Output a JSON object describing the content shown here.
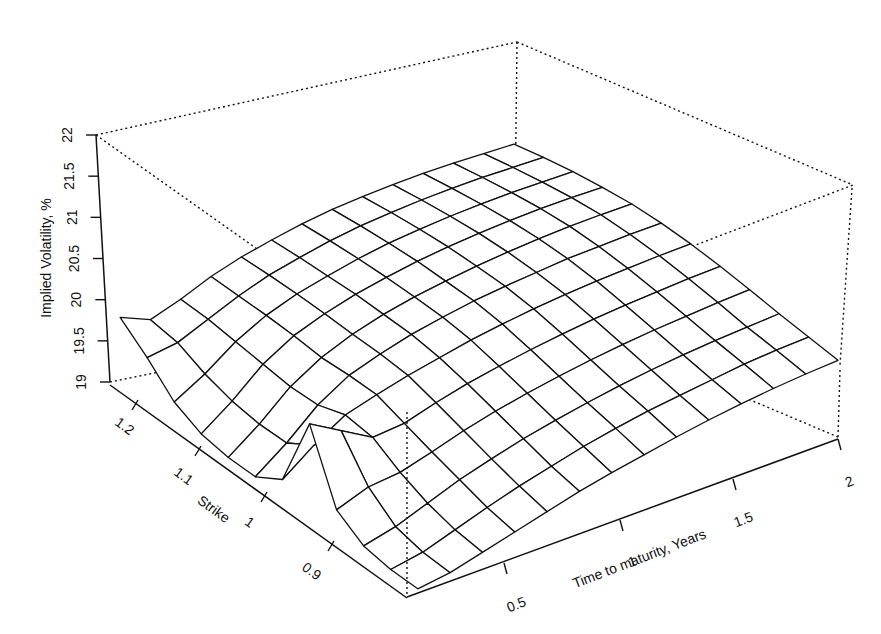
{
  "chart_data": {
    "type": "surface3d",
    "title": "",
    "zlabel": "Implied Volatility, %",
    "xlabel": "Time to maturity, Years",
    "ylabel": "Strike",
    "z_ticks": [
      "19",
      "19.5",
      "20",
      "20.5",
      "21",
      "21.5",
      "22"
    ],
    "x_ticks": [
      "0.5",
      "1",
      "1.5",
      "2"
    ],
    "y_ticks": [
      "1.2",
      "1.1",
      "1",
      "0.9"
    ],
    "zlim": [
      19,
      22
    ],
    "xlim": [
      0,
      2
    ],
    "ylim": [
      0.82,
      1.26
    ],
    "grid": "wireframe mesh, dotted bounding box",
    "strike_grid": [
      0.82,
      0.86,
      0.9,
      0.94,
      0.98,
      1.02,
      1.06,
      1.1,
      1.14,
      1.18,
      1.22,
      1.26
    ],
    "time_grid": [
      0.05,
      0.2,
      0.35,
      0.5,
      0.65,
      0.8,
      0.95,
      1.1,
      1.25,
      1.4,
      1.55,
      1.7,
      1.85,
      2.0
    ],
    "values": [
      [
        19.05,
        19.1,
        19.2,
        19.3,
        19.4,
        19.5,
        19.58,
        19.65,
        19.72,
        19.78,
        19.83,
        19.87,
        19.9,
        19.92
      ],
      [
        19.05,
        19.12,
        19.25,
        19.38,
        19.5,
        19.6,
        19.7,
        19.78,
        19.85,
        19.9,
        19.95,
        20.0,
        20.03,
        20.05
      ],
      [
        19.1,
        19.2,
        19.35,
        19.5,
        19.62,
        19.73,
        19.82,
        19.9,
        19.97,
        20.03,
        20.08,
        20.12,
        20.15,
        20.18
      ],
      [
        19.3,
        19.45,
        19.5,
        19.62,
        19.75,
        19.86,
        19.95,
        20.03,
        20.1,
        20.16,
        20.21,
        20.25,
        20.29,
        20.32
      ],
      [
        20.1,
        19.9,
        19.7,
        19.75,
        19.88,
        19.99,
        20.08,
        20.16,
        20.23,
        20.29,
        20.34,
        20.38,
        20.42,
        20.45
      ],
      [
        19.2,
        19.5,
        19.75,
        19.88,
        20.0,
        20.1,
        20.2,
        20.28,
        20.35,
        20.41,
        20.46,
        20.5,
        20.54,
        20.57
      ],
      [
        19.0,
        19.3,
        19.65,
        19.9,
        20.05,
        20.18,
        20.28,
        20.37,
        20.44,
        20.5,
        20.56,
        20.6,
        20.64,
        20.67
      ],
      [
        19.0,
        19.3,
        19.65,
        19.9,
        20.08,
        20.22,
        20.33,
        20.42,
        20.5,
        20.57,
        20.63,
        20.68,
        20.72,
        20.75
      ],
      [
        19.05,
        19.35,
        19.7,
        19.95,
        20.12,
        20.26,
        20.37,
        20.47,
        20.55,
        20.62,
        20.68,
        20.73,
        20.77,
        20.8
      ],
      [
        19.2,
        19.45,
        19.75,
        19.98,
        20.15,
        20.28,
        20.4,
        20.5,
        20.58,
        20.65,
        20.71,
        20.76,
        20.8,
        20.84
      ],
      [
        19.5,
        19.6,
        19.8,
        20.0,
        20.17,
        20.3,
        20.42,
        20.52,
        20.6,
        20.67,
        20.73,
        20.78,
        20.82,
        20.86
      ],
      [
        19.75,
        19.65,
        19.82,
        20.02,
        20.18,
        20.31,
        20.43,
        20.53,
        20.61,
        20.68,
        20.74,
        20.79,
        20.83,
        20.87
      ]
    ]
  },
  "axes": {
    "z_label": "Implied Volatility, %",
    "x_label": "Time to maturity, Years",
    "y_label": "Strike"
  }
}
